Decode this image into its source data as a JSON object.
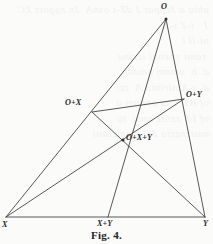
{
  "figure": {
    "caption": "Fig. 4.",
    "background_color": "#fbfbfa",
    "ink_color": "#3a3a3a",
    "label_color": "#2b2b2b"
  },
  "bleed_text": "uhla a Jcppat J dZ-t osnA  Jn zggort ZC\nJ   i-Z i-X    \nni-ll i\n rami vnxnai izzina\nd  b  amnm nmam\nd  z-X nirinta A  zzi\nof tlY  zna annum a\nof Id  zznzz nmu  ta\nmuzznzzia ZD bmmzzaai",
  "labels": [
    {
      "id": "O",
      "text": "O",
      "x": 161,
      "y": 3,
      "anchor": "vertex-top"
    },
    {
      "id": "O+X",
      "text": "O+X",
      "x": 65,
      "y": 99,
      "anchor": "left-of-point"
    },
    {
      "id": "O+Y",
      "text": "O+Y",
      "x": 186,
      "y": 91,
      "anchor": "right-of-point"
    },
    {
      "id": "O+X+Y",
      "text": "O+X+Y",
      "x": 126,
      "y": 134,
      "anchor": "right-of-point"
    },
    {
      "id": "X",
      "text": "X",
      "x": 2,
      "y": 221,
      "anchor": "vertex-bottom-left"
    },
    {
      "id": "X+Y",
      "text": "X+Y",
      "x": 97,
      "y": 220,
      "anchor": "below-base"
    },
    {
      "id": "Y",
      "text": "Y",
      "x": 203,
      "y": 220,
      "anchor": "vertex-bottom-right"
    }
  ],
  "points": [
    {
      "id": "O",
      "x": 166,
      "y": 19,
      "dot": true
    },
    {
      "id": "OX",
      "x": 92,
      "y": 112,
      "dot": false
    },
    {
      "id": "OY",
      "x": 184,
      "y": 99,
      "dot": false
    },
    {
      "id": "OXY",
      "x": 123,
      "y": 140,
      "dot": true
    },
    {
      "id": "X",
      "x": 6,
      "y": 217,
      "dot": false
    },
    {
      "id": "XY",
      "x": 108,
      "y": 217,
      "dot": false
    },
    {
      "id": "Y",
      "x": 205,
      "y": 217,
      "dot": false
    }
  ],
  "segments": [
    {
      "id": "X-O",
      "from": "X",
      "to": "O",
      "desc": "side X to O through O+X"
    },
    {
      "id": "O-Y",
      "from": "O",
      "to": "Y",
      "desc": "side O to Y through O+Y"
    },
    {
      "id": "X-Y",
      "from": "X",
      "to": "Y",
      "desc": "base X to Y through X+Y"
    },
    {
      "id": "O-XY",
      "from": "O",
      "to": "XY",
      "desc": "cevian O to X+Y through O+X+Y"
    },
    {
      "id": "X-OY",
      "from": "X",
      "to": "OY",
      "desc": "cevian X to O+Y through O+X+Y"
    },
    {
      "id": "Y-OX",
      "from": "Y",
      "to": "OX",
      "desc": "cevian Y to O+X through O+X+Y"
    },
    {
      "id": "OX-OY",
      "from": "OX",
      "to": "OY",
      "desc": "harmonic line O+X to O+Y"
    }
  ]
}
